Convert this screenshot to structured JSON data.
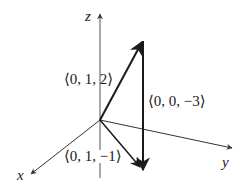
{
  "diagram": {
    "type": "3d-vector-diagram",
    "axes": {
      "x_label": "x",
      "y_label": "y",
      "z_label": "z"
    },
    "vectors": [
      {
        "label": "⟨0, 1, 2⟩",
        "components": [
          0,
          1,
          2
        ]
      },
      {
        "label": "⟨0, 0, −3⟩",
        "components": [
          0,
          0,
          -3
        ]
      },
      {
        "label": "⟨0, 1, −1⟩",
        "components": [
          0,
          1,
          -1
        ]
      }
    ],
    "colors": {
      "axis": "#444444",
      "vector": "#1a1a1a",
      "background": "#ffffff"
    }
  }
}
